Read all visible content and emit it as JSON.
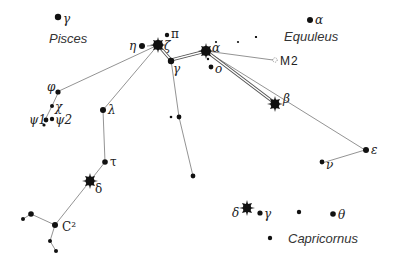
{
  "constellations": [
    {
      "name": "Pisces",
      "x": 50,
      "y": 42
    },
    {
      "name": "Equuleus",
      "x": 312,
      "y": 40
    },
    {
      "name": "Capricornus",
      "x": 288,
      "y": 242
    }
  ],
  "labels": {
    "pisces_gamma": "γ",
    "eta": "η",
    "zeta": "ζ",
    "pi": "π",
    "gamma": "γ",
    "alpha": "α",
    "omicron": "ο",
    "equuleus_alpha": "α",
    "m2": "M2",
    "beta": "β",
    "epsilon": "ε",
    "nu": "ν",
    "phi": "φ",
    "chi": "χ",
    "psi1": "ψ1",
    "psi2": "ψ2",
    "lambda": "λ",
    "tau": "τ",
    "delta": "δ",
    "c2": "C²",
    "cap_delta": "δ",
    "cap_gamma": "γ",
    "cap_theta": "θ"
  },
  "colors": {
    "background": "#ffffff",
    "star": "#111111",
    "line": "#777777",
    "text": "#222222"
  }
}
